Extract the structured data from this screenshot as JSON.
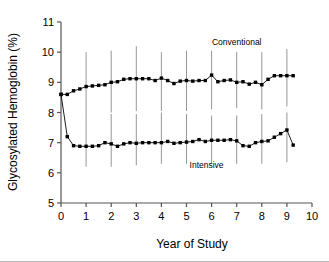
{
  "chart_data": {
    "type": "line",
    "title": "",
    "xlabel": "Year of Study",
    "ylabel": "Glycosylated Hemoglobin (%)",
    "xlim": [
      0,
      10
    ],
    "ylim": [
      5,
      11
    ],
    "xticks": [
      0,
      1,
      2,
      3,
      4,
      5,
      6,
      7,
      8,
      9,
      10
    ],
    "xtick_labels": [
      "0",
      "1",
      "2",
      "3",
      "4",
      "5",
      "6",
      "7",
      "8",
      "9",
      "10"
    ],
    "yticks": [
      5,
      6,
      7,
      8,
      9,
      10,
      11
    ],
    "ytick_labels": [
      "5",
      "6",
      "7",
      "8",
      "9",
      "10",
      "11"
    ],
    "grid": false,
    "legend_position": "inline-annotation",
    "marker": "filled-square",
    "series": [
      {
        "name": "Conventional",
        "label_x": 7.0,
        "label_y": 10.25,
        "color": "#000000",
        "x": [
          0.0,
          0.25,
          0.5,
          0.75,
          1.0,
          1.25,
          1.5,
          1.75,
          2.0,
          2.25,
          2.5,
          2.75,
          3.0,
          3.25,
          3.5,
          3.75,
          4.0,
          4.25,
          4.5,
          4.75,
          5.0,
          5.25,
          5.5,
          5.75,
          6.0,
          6.25,
          6.5,
          6.75,
          7.0,
          7.25,
          7.5,
          7.75,
          8.0,
          8.25,
          8.5,
          8.75,
          9.0,
          9.25
        ],
        "y": [
          8.6,
          8.6,
          8.72,
          8.78,
          8.86,
          8.88,
          8.9,
          8.92,
          9.0,
          9.02,
          9.1,
          9.12,
          9.12,
          9.12,
          9.12,
          9.06,
          9.14,
          9.06,
          8.96,
          9.04,
          9.06,
          9.04,
          9.06,
          9.06,
          9.24,
          9.02,
          9.06,
          9.08,
          9.0,
          9.02,
          8.94,
          9.0,
          8.92,
          9.1,
          9.22,
          9.22,
          9.22,
          9.22
        ],
        "error_bar_years": [
          1,
          2,
          3,
          4,
          5,
          6,
          7,
          8,
          9
        ],
        "error_bar_low": [
          8.0,
          8.0,
          8.05,
          8.05,
          8.05,
          8.1,
          8.15,
          8.1,
          8.2
        ],
        "error_bar_high": [
          10.0,
          10.05,
          10.2,
          10.0,
          10.05,
          10.05,
          10.0,
          10.0,
          10.1
        ]
      },
      {
        "name": "Intensive",
        "label_x": 5.8,
        "label_y": 6.15,
        "color": "#000000",
        "x": [
          0.0,
          0.25,
          0.5,
          0.75,
          1.0,
          1.25,
          1.5,
          1.75,
          2.0,
          2.25,
          2.5,
          2.75,
          3.0,
          3.25,
          3.5,
          3.75,
          4.0,
          4.25,
          4.5,
          4.75,
          5.0,
          5.25,
          5.5,
          5.75,
          6.0,
          6.25,
          6.5,
          6.75,
          7.0,
          7.25,
          7.5,
          7.75,
          8.0,
          8.25,
          8.5,
          8.75,
          9.0,
          9.25
        ],
        "y": [
          8.6,
          7.2,
          6.9,
          6.88,
          6.88,
          6.88,
          6.9,
          7.0,
          6.96,
          6.88,
          6.96,
          7.0,
          6.98,
          7.0,
          7.0,
          7.0,
          7.0,
          7.04,
          6.98,
          7.0,
          7.02,
          7.04,
          7.1,
          7.04,
          7.08,
          7.08,
          7.08,
          7.1,
          7.06,
          6.9,
          6.88,
          7.0,
          7.04,
          7.06,
          7.18,
          7.3,
          7.42,
          6.92
        ],
        "error_bar_years": [
          1,
          2,
          3,
          4,
          5,
          6,
          7,
          8,
          9
        ],
        "error_bar_low": [
          6.2,
          6.2,
          6.25,
          6.3,
          6.3,
          6.3,
          6.3,
          6.3,
          6.35
        ],
        "error_bar_high": [
          8.0,
          7.95,
          7.95,
          8.0,
          7.95,
          7.9,
          7.9,
          7.95,
          8.0
        ]
      }
    ]
  }
}
